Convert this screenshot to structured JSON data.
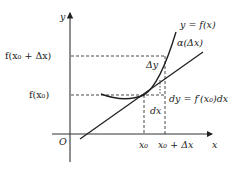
{
  "diagram": {
    "axes": {
      "y_label": "y",
      "x_label": "x",
      "origin_label": "O"
    },
    "y_ticks": {
      "fx0dx": "f(x₀ + Δx)",
      "fx0": "f(x₀)"
    },
    "x_ticks": {
      "x0": "x₀",
      "x0dx": "x₀ + Δx"
    },
    "curve_label": "y = f(x)",
    "remainder_label": "α(Δx)",
    "delta_y_label": "Δy",
    "dy_label": "dy = f′(x₀)dx",
    "dx_label": "dx",
    "colors": {
      "line": "#222222",
      "axis": "#333333",
      "dashed": "#333333"
    }
  }
}
